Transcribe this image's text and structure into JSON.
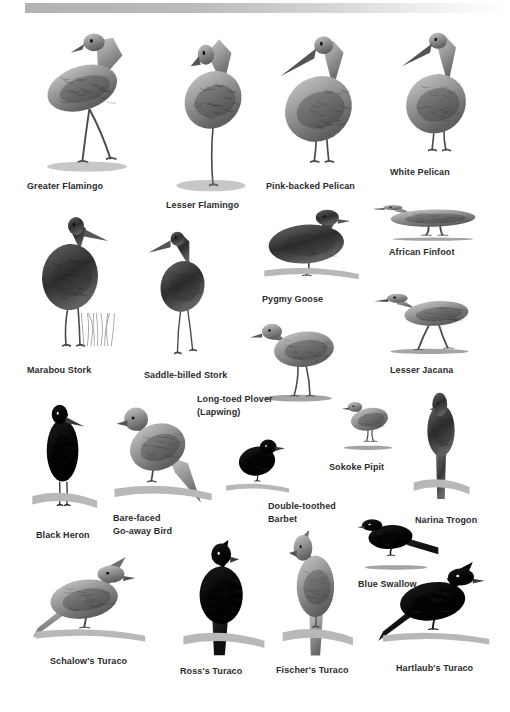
{
  "page": {
    "background_color": "#ffffff",
    "header_bar_color": "#b0b2b4",
    "caption_color": "#2b2b2b",
    "width": 510,
    "height": 712
  },
  "plate": {
    "kind": "field-guide-bird-plate",
    "species": [
      {
        "id": "greater-flamingo",
        "label": "Greater Flamingo",
        "label_x": 27,
        "label_y": 181,
        "align": "left",
        "bird_x": 28,
        "bird_y": 26,
        "bird_w": 118,
        "bird_h": 148
      },
      {
        "id": "lesser-flamingo",
        "label": "Lesser Flamingo",
        "label_x": 166,
        "label_y": 200,
        "align": "left",
        "bird_x": 160,
        "bird_y": 26,
        "bird_w": 102,
        "bird_h": 168
      },
      {
        "id": "pink-backed-pelican",
        "label": "Pink-backed Pelican",
        "label_x": 266,
        "label_y": 181,
        "align": "left",
        "bird_x": 268,
        "bird_y": 26,
        "bird_w": 105,
        "bird_h": 148
      },
      {
        "id": "white-pelican",
        "label": "White Pelican",
        "label_x": 390,
        "label_y": 167,
        "align": "left",
        "bird_x": 388,
        "bird_y": 26,
        "bird_w": 100,
        "bird_h": 134
      },
      {
        "id": "african-finfoot",
        "label": "African Finfoot",
        "label_x": 389,
        "label_y": 247,
        "align": "left",
        "bird_x": 374,
        "bird_y": 196,
        "bird_w": 118,
        "bird_h": 48
      },
      {
        "id": "pygmy-goose",
        "label": "Pygmy Goose",
        "label_x": 262,
        "label_y": 294,
        "align": "left",
        "bird_x": 258,
        "bird_y": 200,
        "bird_w": 105,
        "bird_h": 88
      },
      {
        "id": "lesser-jacana",
        "label": "Lesser Jacana",
        "label_x": 390,
        "label_y": 365,
        "align": "left",
        "bird_x": 372,
        "bird_y": 283,
        "bird_w": 115,
        "bird_h": 76
      },
      {
        "id": "marabou-stork",
        "label": "Marabou Stork",
        "label_x": 27,
        "label_y": 365,
        "align": "left",
        "bird_x": 22,
        "bird_y": 208,
        "bird_w": 100,
        "bird_h": 150
      },
      {
        "id": "saddle-billed-stork",
        "label": "Saddle-billed Stork",
        "label_x": 144,
        "label_y": 370,
        "align": "left",
        "bird_x": 140,
        "bird_y": 222,
        "bird_w": 85,
        "bird_h": 140
      },
      {
        "id": "long-toed-plover",
        "label": "Long-toed Plover\n(Lapwing)",
        "label_x": 197,
        "label_y": 393,
        "align": "left",
        "bird_x": 248,
        "bird_y": 310,
        "bird_w": 100,
        "bird_h": 98
      },
      {
        "id": "sokoke-pipit",
        "label": "Sokoke Pipit",
        "label_x": 329,
        "label_y": 462,
        "align": "left",
        "bird_x": 332,
        "bird_y": 392,
        "bird_w": 72,
        "bird_h": 62
      },
      {
        "id": "narina-trogon",
        "label": "Narina Trogon",
        "label_x": 415,
        "label_y": 515,
        "align": "left",
        "bird_x": 410,
        "bird_y": 388,
        "bird_w": 62,
        "bird_h": 118
      },
      {
        "id": "black-heron",
        "label": "Black Heron",
        "label_x": 36,
        "label_y": 530,
        "align": "left",
        "bird_x": 28,
        "bird_y": 400,
        "bird_w": 72,
        "bird_h": 120
      },
      {
        "id": "bare-faced-go-away-bird",
        "label": "Bare-faced\nGo-away Bird",
        "label_x": 113,
        "label_y": 512,
        "align": "left",
        "bird_x": 108,
        "bird_y": 396,
        "bird_w": 108,
        "bird_h": 116
      },
      {
        "id": "double-toothed-barbet",
        "label": "Double-toothed\nBarbet",
        "label_x": 268,
        "label_y": 500,
        "align": "left",
        "bird_x": 222,
        "bird_y": 428,
        "bird_w": 70,
        "bird_h": 72
      },
      {
        "id": "blue-swallow",
        "label": "Blue Swallow",
        "label_x": 358,
        "label_y": 579,
        "align": "left",
        "bird_x": 350,
        "bird_y": 508,
        "bird_w": 92,
        "bird_h": 66
      },
      {
        "id": "schalows-turaco",
        "label": "Schalow's Turaco",
        "label_x": 50,
        "label_y": 656,
        "align": "left",
        "bird_x": 28,
        "bird_y": 555,
        "bird_w": 122,
        "bird_h": 96
      },
      {
        "id": "rosss-turaco",
        "label": "Ross's Turaco",
        "label_x": 180,
        "label_y": 666,
        "align": "left",
        "bird_x": 178,
        "bird_y": 540,
        "bird_w": 90,
        "bird_h": 120
      },
      {
        "id": "fischers-turaco",
        "label": "Fischer's Turaco",
        "label_x": 276,
        "label_y": 665,
        "align": "left",
        "bird_x": 278,
        "bird_y": 530,
        "bird_w": 78,
        "bird_h": 128
      },
      {
        "id": "hartlaubs-turaco",
        "label": "Hartlaub's Turaco",
        "label_x": 396,
        "label_y": 663,
        "align": "left",
        "bird_x": 376,
        "bird_y": 560,
        "bird_w": 118,
        "bird_h": 94
      }
    ]
  }
}
